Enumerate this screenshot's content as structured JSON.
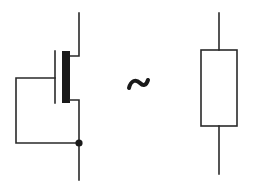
{
  "diagram": {
    "left_symbol": {
      "name": "mosfet",
      "gate_source_shorted": true,
      "channel_color": "#1a1a1a",
      "wire_color": "#2a2a2a"
    },
    "equivalence_symbol": {
      "glyph": "~",
      "meaning": "approximately equivalent"
    },
    "right_symbol": {
      "name": "resistor",
      "wire_color": "#2a2a2a"
    }
  }
}
